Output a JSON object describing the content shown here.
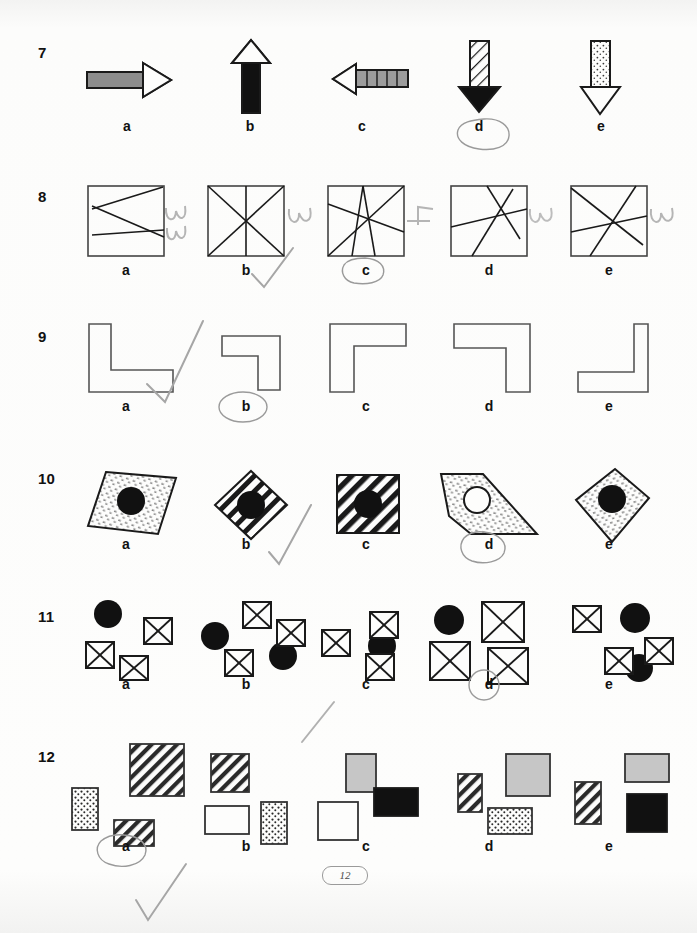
{
  "page": {
    "page_number": "12",
    "background_color": "#fbfbfa",
    "ink_color": "#1a1a1a",
    "pencil_color": "#8e8e8e"
  },
  "items": [
    {
      "number": "7",
      "prompt_type": "arrow-comparison",
      "options": [
        {
          "label": "a",
          "description": "grey-filled right-pointing arrow, horizontal"
        },
        {
          "label": "b",
          "description": "black-filled up-pointing arrow, vertical"
        },
        {
          "label": "c",
          "description": "grey segmented left-pointing arrow, horizontal"
        },
        {
          "label": "d",
          "description": "hatched down-pointing arrow with black head, vertical"
        },
        {
          "label": "e",
          "description": "stippled down-pointing arrow with open head, vertical"
        }
      ],
      "marked_answer": "d"
    },
    {
      "number": "8",
      "prompt_type": "count-lines-in-square",
      "options": [
        {
          "label": "a",
          "description": "square crossed by 3 straight lines",
          "handwritten_count": "3"
        },
        {
          "label": "b",
          "description": "square crossed by 3 lines through centre",
          "handwritten_count": "3"
        },
        {
          "label": "c",
          "description": "square crossed by 4 lines through centre",
          "handwritten_count": "4"
        },
        {
          "label": "d",
          "description": "square crossed by 3 lines",
          "handwritten_count": "3"
        },
        {
          "label": "e",
          "description": "square crossed by 3 lines through centre",
          "handwritten_count": "3"
        }
      ],
      "marked_answer": "c"
    },
    {
      "number": "9",
      "prompt_type": "l-shape-rotation",
      "options": [
        {
          "label": "a",
          "description": "L-shape, opening up-right"
        },
        {
          "label": "b",
          "description": "small L-shape rotated, opening down-left"
        },
        {
          "label": "c",
          "description": "L-shape opening down-right, tall left arm"
        },
        {
          "label": "d",
          "description": "L-shape opening down-left, tall right arm"
        },
        {
          "label": "e",
          "description": "L-shape opening up-left, short arms"
        }
      ],
      "marked_answer": "b"
    },
    {
      "number": "10",
      "prompt_type": "quadrilateral-with-disc",
      "options": [
        {
          "label": "a",
          "description": "stippled parallelogram with black disc"
        },
        {
          "label": "b",
          "description": "striped diamond with black disc"
        },
        {
          "label": "c",
          "description": "diagonally hatched square with black disc"
        },
        {
          "label": "d",
          "description": "stippled trapezium with white disc"
        },
        {
          "label": "e",
          "description": "stippled kite with black disc"
        }
      ],
      "marked_answer": "d"
    },
    {
      "number": "11",
      "prompt_type": "count-crossed-squares",
      "options": [
        {
          "label": "a",
          "description": "1 black disc and 3 crossed squares"
        },
        {
          "label": "b",
          "description": "2 black discs and 3 crossed squares"
        },
        {
          "label": "c",
          "description": "1 black disc and 3 crossed squares"
        },
        {
          "label": "d",
          "description": "1 black disc and 3 large crossed squares"
        },
        {
          "label": "e",
          "description": "2 black discs and 3 crossed squares"
        }
      ],
      "marked_answer": "d"
    },
    {
      "number": "12",
      "prompt_type": "rectangle-fill-comparison",
      "options": [
        {
          "label": "a",
          "description": "stippled, large hatched and small hatched rectangles"
        },
        {
          "label": "b",
          "description": "hatched square, white rectangle and stippled rectangle"
        },
        {
          "label": "c",
          "description": "grey rectangle, black rectangle and white square"
        },
        {
          "label": "d",
          "description": "hatched rectangle, grey square and stippled rectangle"
        },
        {
          "label": "e",
          "description": "grey rectangle, hatched rectangle and black square"
        }
      ],
      "marked_answer": "a"
    }
  ],
  "annotations": {
    "circled_answers": [
      "d",
      "c",
      "b",
      "d",
      "d",
      "a"
    ],
    "check_marks": 4,
    "handwritten_numbers": [
      "3",
      "3",
      "4",
      "3",
      "3"
    ]
  }
}
